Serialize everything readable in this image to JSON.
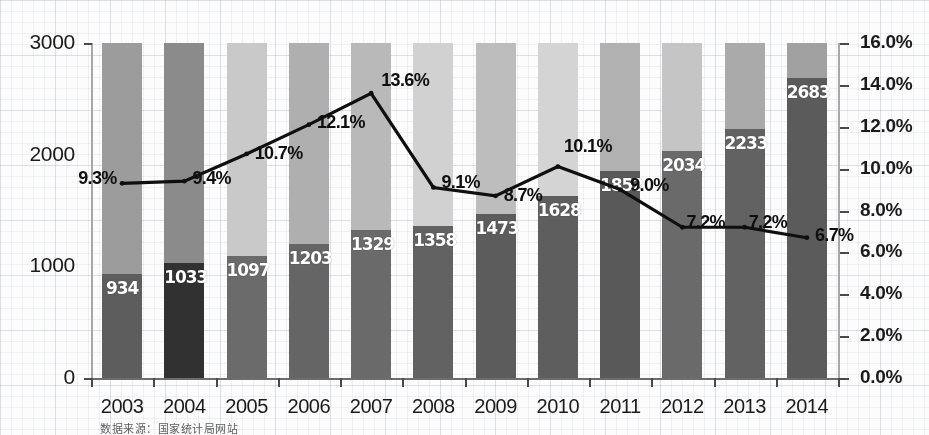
{
  "chart_data": {
    "type": "bar",
    "title": "",
    "subtitle": "",
    "xlabel": "",
    "ylabel": "",
    "categories": [
      "2003",
      "2004",
      "2005",
      "2006",
      "2007",
      "2008",
      "2009",
      "2010",
      "2011",
      "2012",
      "2013",
      "2014"
    ],
    "series": [
      {
        "name": "value",
        "axis": "left",
        "type": "bar",
        "values": [
          934,
          1033,
          1097,
          1203,
          1329,
          1358,
          1473,
          1628,
          1852,
          2034,
          2233,
          2683
        ],
        "labels": [
          "934",
          "1033",
          "1097",
          "1203",
          "1329",
          "1358",
          "1473",
          "1628",
          "1852",
          "2034",
          "2233",
          "2683"
        ]
      },
      {
        "name": "growth_rate",
        "axis": "right",
        "type": "line",
        "values": [
          9.3,
          9.4,
          10.7,
          12.1,
          13.6,
          9.1,
          8.7,
          10.1,
          9.0,
          7.2,
          7.2,
          6.7
        ],
        "labels": [
          "9.3%",
          "9.4%",
          "10.7%",
          "12.1%",
          "13.6%",
          "9.1%",
          "8.7%",
          "10.1%",
          "9.0%",
          "7.2%",
          "7.2%",
          "6.7%"
        ]
      }
    ],
    "left_axis": {
      "ticks": [
        "0",
        "1000",
        "2000",
        "3000"
      ],
      "values": [
        0,
        1000,
        2000,
        3000
      ],
      "min": 0,
      "max": 3000
    },
    "right_axis": {
      "ticks": [
        "0.0%",
        "2.0%",
        "4.0%",
        "6.0%",
        "8.0%",
        "10.0%",
        "12.0%",
        "14.0%",
        "16.0%"
      ],
      "values": [
        0,
        2,
        4,
        6,
        8,
        10,
        12,
        14,
        16
      ],
      "min": 0,
      "max": 16
    },
    "grid": false,
    "legend": "none",
    "colors": {
      "bar_default": "#606060",
      "bar_highlight": "#333333",
      "band_default": "#9e9e9e",
      "line": "#111111",
      "bar_label_text": "#ffffff",
      "axis_text": "#1d1d1d"
    },
    "band_shades": [
      "#9b9b9b",
      "#8b8b8b",
      "#c8c8c8",
      "#aeaeae",
      "#b8b8b8",
      "#cfcfcf",
      "#bcbcbc",
      "#d2d2d2",
      "#b0b0b0",
      "#c4c4c4",
      "#a9a9a9",
      "#a0a0a0"
    ],
    "bar_shades": [
      "#5e5e5e",
      "#333333",
      "#6b6b6b",
      "#666666",
      "#6a6a6a",
      "#636363",
      "#5d5d5d",
      "#5f5f5f",
      "#5a5a5a",
      "#6a6a6a",
      "#636363",
      "#5c5c5c"
    ]
  },
  "caption": {
    "source_note": "数据来源：国家统计局网站"
  }
}
